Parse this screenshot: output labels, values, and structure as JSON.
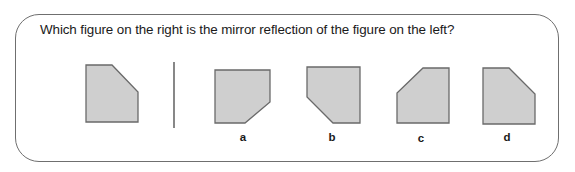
{
  "question": {
    "text": "Which figure on the right is the mirror reflection of the figure on the left?"
  },
  "colors": {
    "shape_fill": "#cfcfcf",
    "shape_stroke": "#6a6a6a",
    "border": "#6f6f6f",
    "text": "#1a1a1a"
  },
  "reference_figure": {
    "description": "pentagon with top-right corner cut"
  },
  "options": [
    {
      "label": "a",
      "description": "pentagon with bottom-right corner cut"
    },
    {
      "label": "b",
      "description": "pentagon with bottom-left corner cut"
    },
    {
      "label": "c",
      "description": "pentagon with top-left corner cut"
    },
    {
      "label": "d",
      "description": "pentagon with top-right corner cut"
    }
  ]
}
